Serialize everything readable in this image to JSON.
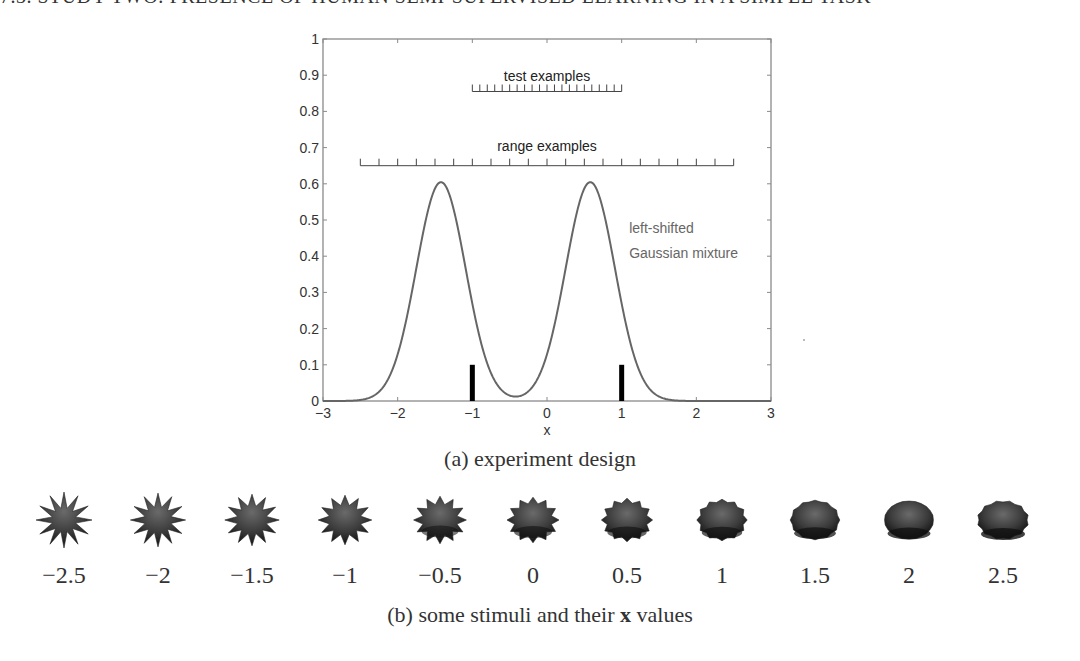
{
  "running_head": "7.3. STUDY TWO: PRESENCE OF HUMAN SEMI-SUPERVISED LEARNING IN A SIMPLE TASK",
  "figure": {
    "caption_a": "(a) experiment design",
    "caption_b_prefix": "(b) some stimuli and their ",
    "caption_b_bold": "x",
    "caption_b_suffix": " values"
  },
  "chart_data": {
    "type": "line",
    "title": "",
    "xlabel": "x",
    "ylabel": "",
    "xlim": [
      -3,
      3
    ],
    "ylim": [
      0,
      1
    ],
    "grid": false,
    "x_ticks": [
      -3,
      -2,
      -1,
      0,
      1,
      2,
      3
    ],
    "y_ticks": [
      0,
      0.1,
      0.2,
      0.3,
      0.4,
      0.5,
      0.6,
      0.7,
      0.8,
      0.9,
      1
    ],
    "y_tick_labels": [
      "0",
      "0.1",
      "0.2",
      "0.3",
      "0.4",
      "0.5",
      "0.6",
      "0.7",
      "0.8",
      "0.9",
      "1"
    ],
    "series": [
      {
        "name": "left-shifted Gaussian mixture",
        "kind": "gaussian_mixture",
        "components": [
          {
            "weight": 0.5,
            "mean": -1.42,
            "sigma": 0.33
          },
          {
            "weight": 0.5,
            "mean": 0.58,
            "sigma": 0.33
          }
        ],
        "peak_height": 0.605,
        "color": "#666666"
      }
    ],
    "bars": [
      {
        "x": -1,
        "height": 0.1,
        "color": "#000000"
      },
      {
        "x": 1,
        "height": 0.1,
        "color": "#000000"
      }
    ],
    "annotations": [
      {
        "text": "test examples",
        "x": 0,
        "y": 0.885
      },
      {
        "text": "range examples",
        "x": 0,
        "y": 0.69
      },
      {
        "text": "left-shifted",
        "x": 1.1,
        "y": 0.465
      },
      {
        "text": "Gaussian mixture",
        "x": 1.1,
        "y": 0.395
      }
    ],
    "rulers": [
      {
        "name": "test examples",
        "from": -1,
        "to": 1,
        "step": 0.1,
        "y": 0.855
      },
      {
        "name": "range examples",
        "from": -2.5,
        "to": 2.5,
        "step": 0.25,
        "y": 0.65
      }
    ]
  },
  "stimuli": [
    {
      "x_value": "−2.5",
      "v": -2.5
    },
    {
      "x_value": "−2",
      "v": -2
    },
    {
      "x_value": "−1.5",
      "v": -1.5
    },
    {
      "x_value": "−1",
      "v": -1
    },
    {
      "x_value": "−0.5",
      "v": -0.5
    },
    {
      "x_value": "0",
      "v": 0
    },
    {
      "x_value": "0.5",
      "v": 0.5
    },
    {
      "x_value": "1",
      "v": 1
    },
    {
      "x_value": "1.5",
      "v": 1.5
    },
    {
      "x_value": "2",
      "v": 2
    },
    {
      "x_value": "2.5",
      "v": 2.5
    }
  ]
}
